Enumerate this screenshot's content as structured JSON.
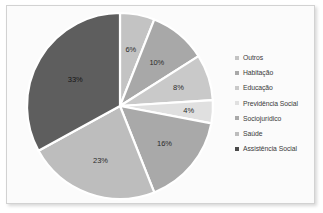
{
  "chart_data": {
    "type": "pie",
    "title": "",
    "legend_position": "right",
    "categories": [
      "Outros",
      "Habitação",
      "Educação",
      "Previdência Social",
      "Sociojurídico",
      "Saúde",
      "Assistência Social"
    ],
    "values": [
      6,
      10,
      8,
      4,
      16,
      23,
      33
    ],
    "value_labels": [
      "6%",
      "10%",
      "8%",
      "4%",
      "16%",
      "23%",
      "33%"
    ],
    "unit": "%",
    "colors": [
      "#c3c3c3",
      "#a8a8a8",
      "#c9c9c9",
      "#e0e0e0",
      "#a9a9a9",
      "#bdbdbd",
      "#5e5e5e"
    ],
    "slice_separator_color": "#ffffff",
    "start_angle_deg": 0,
    "direction": "clockwise"
  },
  "frame": {
    "background": "#fbfbfb",
    "border_color": "#d2d2d2"
  },
  "legend": {
    "items": [
      {
        "label": "Outros",
        "marker_color": "#c3c3c3"
      },
      {
        "label": "Habitação",
        "marker_color": "#a8a8a8"
      },
      {
        "label": "Educação",
        "marker_color": "#c9c9c9"
      },
      {
        "label": "Previdência Social",
        "marker_color": "#e0e0e0"
      },
      {
        "label": "Sociojurídico",
        "marker_color": "#a9a9a9"
      },
      {
        "label": "Saúde",
        "marker_color": "#bdbdbd"
      },
      {
        "label": "Assistência Social",
        "marker_color": "#4a4a4a"
      }
    ]
  }
}
